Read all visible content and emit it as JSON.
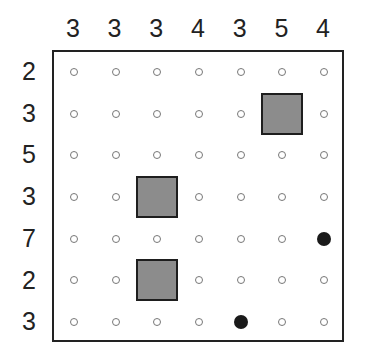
{
  "puzzle": {
    "type": "battleship-style grid",
    "size": 7,
    "column_clues": [
      "3",
      "3",
      "3",
      "4",
      "3",
      "5",
      "4"
    ],
    "row_clues": [
      "2",
      "3",
      "5",
      "3",
      "7",
      "2",
      "3"
    ],
    "cells": [
      [
        "empty",
        "empty",
        "empty",
        "empty",
        "empty",
        "empty",
        "empty"
      ],
      [
        "empty",
        "empty",
        "empty",
        "empty",
        "empty",
        "block",
        "empty"
      ],
      [
        "empty",
        "empty",
        "empty",
        "empty",
        "empty",
        "empty",
        "empty"
      ],
      [
        "empty",
        "empty",
        "block",
        "empty",
        "empty",
        "empty",
        "empty"
      ],
      [
        "empty",
        "empty",
        "empty",
        "empty",
        "empty",
        "empty",
        "dot"
      ],
      [
        "empty",
        "empty",
        "block",
        "empty",
        "empty",
        "empty",
        "empty"
      ],
      [
        "empty",
        "empty",
        "empty",
        "empty",
        "dot",
        "empty",
        "empty"
      ]
    ],
    "colors": {
      "block_fill": "#8c8c8c",
      "block_border": "#1e1e1e",
      "dot": "#1a1a1a",
      "grid_border": "#222222",
      "empty_marker": "#777777"
    }
  }
}
